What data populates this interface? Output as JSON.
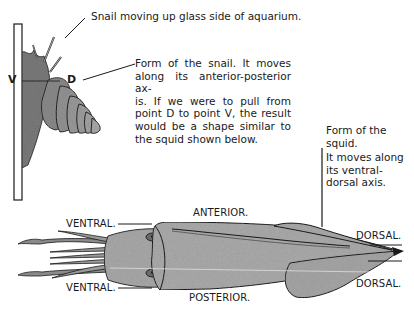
{
  "snail_figure": {
    "caption": "Snail moving up glass side of aquarium.",
    "point_v": "V",
    "point_d": "D",
    "description_lines": [
      "Form of the snail. It moves",
      "along its anterior-posterior ax-",
      "is. If we were to pull from",
      "point D to point V, the result",
      "would be a shape similar to",
      "the squid shown below."
    ]
  },
  "squid_figure": {
    "description_lines": [
      "Form of the",
      "squid.",
      "It moves along",
      "its ventral-",
      "dorsal axis."
    ],
    "labels": {
      "anterior": "ANTERIOR.",
      "posterior": "POSTERIOR.",
      "ventral_top": "VENTRAL.",
      "ventral_bottom": "VENTRAL.",
      "dorsal_top": "DORSAL.",
      "dorsal_bottom": "DORSAL."
    }
  },
  "colors": {
    "ink": "#1a1a1a",
    "body_fill": "#a9a9a9",
    "shell_fill": "#8e8e8e",
    "background": "#ffffff"
  }
}
